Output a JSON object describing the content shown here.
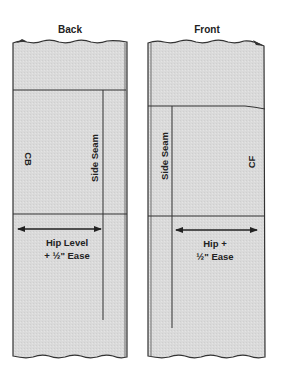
{
  "diagram": {
    "type": "pattern-drafting",
    "panels": [
      {
        "name": "back",
        "title": "Back",
        "center_label": "CB",
        "seam_label": "Side Seam",
        "measure_line1": "Hip Level",
        "measure_line2": "+ ½\" Ease"
      },
      {
        "name": "front",
        "title": "Front",
        "center_label": "CF",
        "seam_label": "Side Seam",
        "measure_line1": "Hip +",
        "measure_line2": "½\" Ease"
      }
    ],
    "colors": {
      "fill": "#dcdcdc",
      "line": "#333333",
      "text": "#222222"
    }
  }
}
